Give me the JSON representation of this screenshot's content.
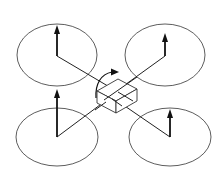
{
  "diagram": {
    "colors": {
      "stroke": "#222222",
      "background": "#ffffff"
    },
    "rotors": [
      {
        "id": "front-left",
        "center": [
          57,
          55
        ],
        "rx": 40,
        "ry": 31,
        "thrust_tip": [
          57,
          26
        ]
      },
      {
        "id": "front-right",
        "center": [
          165,
          55
        ],
        "rx": 40,
        "ry": 31,
        "thrust_tip": [
          165,
          33
        ]
      },
      {
        "id": "rear-left",
        "center": [
          57,
          137
        ],
        "rx": 41,
        "ry": 29,
        "thrust_tip": [
          57,
          90
        ]
      },
      {
        "id": "rear-right",
        "center": [
          170,
          137
        ],
        "rx": 41,
        "ry": 29,
        "thrust_tip": [
          170,
          110
        ]
      }
    ],
    "body": {
      "shape": "isometric-box"
    },
    "yaw_moment": {
      "shape": "curved-arrow"
    }
  }
}
